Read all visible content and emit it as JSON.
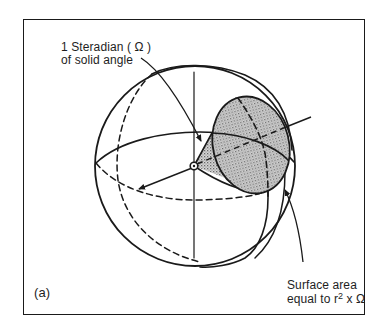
{
  "figure": {
    "panel_label": "(a)",
    "labels": {
      "steradian_line1": "1 Steradian ( Ω )",
      "steradian_line2": "of solid angle",
      "surface_line1": "Surface area",
      "surface_line2_prefix": "equal to r",
      "surface_line2_sup": "2",
      "surface_line2_suffix": " x Ω"
    },
    "colors": {
      "ink": "#1a1a1a",
      "shade": "#bdbdbd",
      "background": "#ffffff"
    },
    "elements": [
      "sphere-outline",
      "equator",
      "vertical-axis",
      "meridian-front",
      "meridian-back-dashed",
      "cone",
      "cap-ellipse-shaded",
      "cone-axis",
      "radius-arrow",
      "center-point",
      "leader-steradian",
      "leader-surface-area"
    ]
  }
}
